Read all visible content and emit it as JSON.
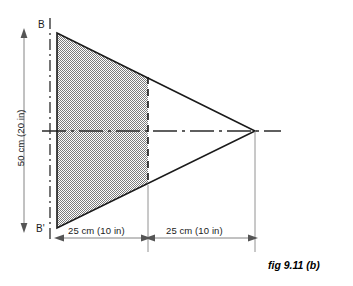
{
  "figure": {
    "caption": "fig 9.11 (b)",
    "labels": {
      "top_datum": "B",
      "bottom_datum": "B'",
      "height_dimension": "50 cm (20 in)",
      "left_dimension": "25 cm (10 in)",
      "right_dimension": "25 cm (10 in)"
    },
    "colors": {
      "outline": "#1a1a1a",
      "shading": "#b4b4b4",
      "thin_line": "#555555",
      "background": "#ffffff"
    },
    "geometry": {
      "triangle_top_left": [
        57,
        33
      ],
      "triangle_bottom_left": [
        57,
        228
      ],
      "triangle_apex": [
        255,
        131
      ],
      "shaded_split_x": 148,
      "centerline_y": 131,
      "chain_line_x": 50,
      "dimension_line_y": 238
    }
  }
}
